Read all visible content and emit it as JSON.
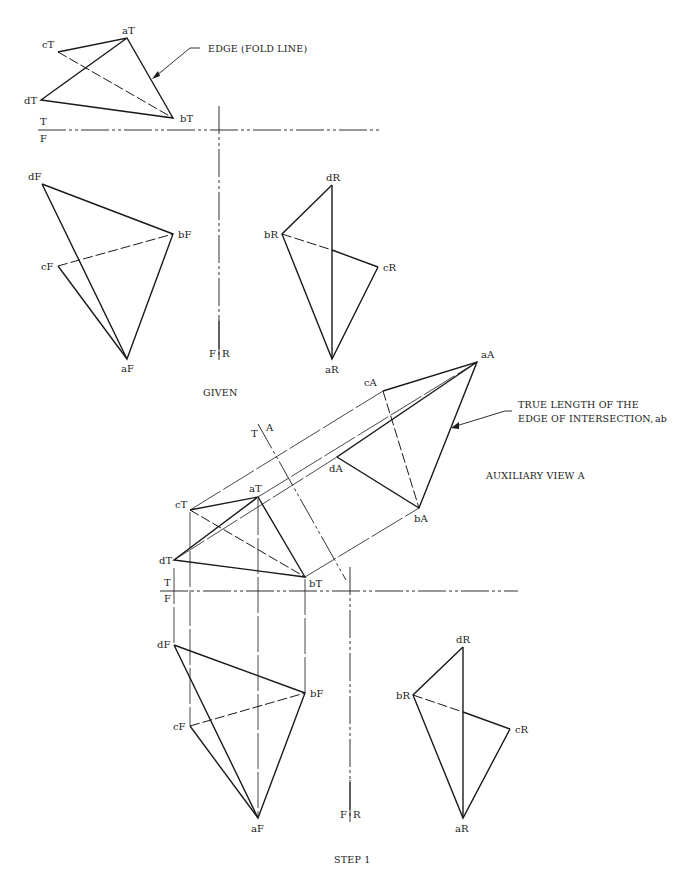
{
  "labels": {
    "given": {
      "top": {
        "aT": "aT",
        "bT": "bT",
        "cT": "cT",
        "dT": "dT"
      },
      "front": {
        "aF": "aF",
        "bF": "bF",
        "cF": "cF",
        "dF": "dF"
      },
      "right": {
        "aR": "aR",
        "bR": "bR",
        "cR": "cR",
        "dR": "dR"
      },
      "fold_tf": {
        "t": "T",
        "f": "F"
      },
      "fold_fr": {
        "f": "F",
        "r": "R"
      },
      "annotation_edge": "EDGE (FOLD LINE)",
      "caption": "GIVEN"
    },
    "step1": {
      "top": {
        "aT": "aT",
        "bT": "bT",
        "cT": "cT",
        "dT": "dT"
      },
      "front": {
        "aF": "aF",
        "bF": "bF",
        "cF": "cF",
        "dF": "dF"
      },
      "right": {
        "aR": "aR",
        "bR": "bR",
        "cR": "cR",
        "dR": "dR"
      },
      "aux": {
        "aA": "aA",
        "bA": "bA",
        "cA": "cA",
        "dA": "dA"
      },
      "fold_tf": {
        "t": "T",
        "f": "F"
      },
      "fold_fr": {
        "f": "F",
        "r": "R"
      },
      "fold_ta": {
        "t": "T",
        "a": "A"
      },
      "annotation_true_length_line1": "TRUE LENGTH OF THE",
      "annotation_true_length_line2": "EDGE OF INTERSECTION,",
      "annotation_true_length_ab": "ab",
      "aux_view_title": "AUXILIARY VIEW A",
      "caption": "STEP 1"
    }
  }
}
